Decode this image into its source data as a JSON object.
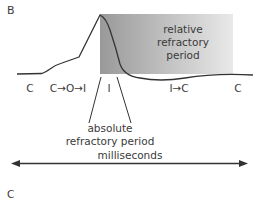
{
  "panel_labels": {
    "top": "B",
    "bottom": "C"
  },
  "shaded_region": {
    "label_lines": [
      "relative",
      "refractory",
      "period"
    ],
    "gradient_start": "#999999",
    "gradient_end": "#e9e9e9"
  },
  "state_labels": [
    {
      "id": "c-left",
      "text": "C"
    },
    {
      "id": "c-o-i",
      "text": "C→O→I"
    },
    {
      "id": "i",
      "text": "I"
    },
    {
      "id": "i-c",
      "text": "I→C"
    },
    {
      "id": "c-right",
      "text": "C"
    }
  ],
  "absolute_label": {
    "line1": "absolute",
    "line2": "refractory period"
  },
  "time_axis": {
    "label": "milliseconds"
  },
  "colors": {
    "curve": "#333333",
    "text": "#3a3a3a",
    "arrow": "#333333"
  }
}
